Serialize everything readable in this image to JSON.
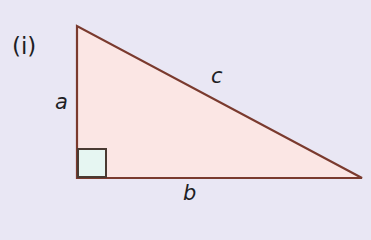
{
  "figure": {
    "label": "(i)",
    "sides": {
      "a": "a",
      "b": "b",
      "c": "c"
    },
    "colors": {
      "background": "#e9e7f4",
      "triangle_fill": "#fbe6e4",
      "outline": "#7a3a2e",
      "right_angle_fill": "#e6f6f2"
    }
  }
}
